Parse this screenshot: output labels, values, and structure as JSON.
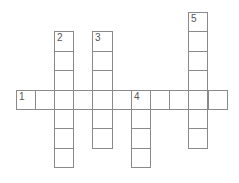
{
  "crossword": {
    "origin": {
      "x": 15.5,
      "y": 12
    },
    "cell_w": 19.2,
    "cell_h": 19.4,
    "line_color": "#8a8a8a",
    "number_color": "#555555",
    "entries": [
      {
        "number": "1",
        "direction": "across",
        "col": 0,
        "row": 4,
        "length": 11
      },
      {
        "number": "2",
        "direction": "down",
        "col": 2,
        "row": 1,
        "length": 7
      },
      {
        "number": "3",
        "direction": "down",
        "col": 4,
        "row": 1,
        "length": 6
      },
      {
        "number": "4",
        "direction": "down",
        "col": 6,
        "row": 4,
        "length": 4
      },
      {
        "number": "5",
        "direction": "down",
        "col": 9,
        "row": 0,
        "length": 7
      }
    ]
  }
}
